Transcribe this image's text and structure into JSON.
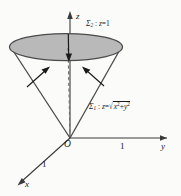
{
  "figure": {
    "canvas": {
      "width": 196,
      "height": 196,
      "background": "#fbfbfa"
    },
    "colors": {
      "stroke": "#3a3a3a",
      "disk_fill": "#b5b5b5",
      "disk_stroke": "#4a4a4a",
      "text": "#1a1a1a",
      "dashed": "#777777"
    },
    "axes": {
      "z": {
        "letter": "z",
        "direction": "up"
      },
      "y": {
        "letter": "y",
        "direction": "right",
        "tick_label": "1"
      },
      "x": {
        "letter": "x",
        "direction": "down-left",
        "tick_label": "1"
      },
      "origin_label": "O"
    },
    "labels": {
      "sigma2": {
        "sigma": "Σ",
        "subscript": "2",
        "separator": " : ",
        "variable": "z",
        "equals": "=",
        "value": "1",
        "full_text": "Σ2 : z=1"
      },
      "sigma1": {
        "sigma": "Σ",
        "subscript": "1",
        "separator": " : ",
        "variable": "z",
        "equals": "=",
        "radicand_x": "x",
        "radicand_exp": "2",
        "radicand_plus": "+",
        "radicand_y": "y",
        "full_text": "Σ1 : z=√(x²+y²)"
      }
    },
    "annotations": {
      "normal_arrow_left": "outward normal on cone left side",
      "normal_arrow_right": "outward normal on cone right side",
      "normal_arrow_down": "downward normal at disk center"
    }
  }
}
